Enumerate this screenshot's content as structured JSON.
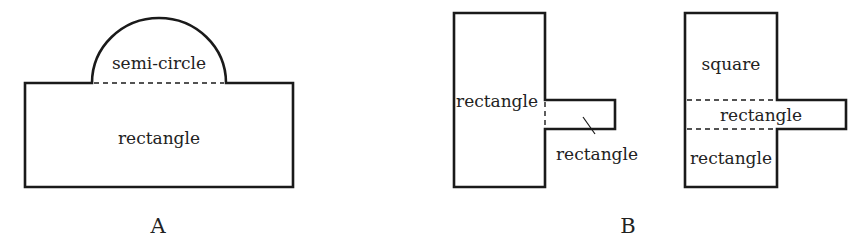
{
  "figures": {
    "A": {
      "caption": "A",
      "labels": {
        "semicircle": "semi-circle",
        "rectangle": "rectangle"
      }
    },
    "B": {
      "caption": "B",
      "left": {
        "labels": {
          "main_rectangle": "rectangle",
          "tab_rectangle": "rectangle"
        }
      },
      "right": {
        "labels": {
          "square": "square",
          "middle_rectangle": "rectangle",
          "bottom_rectangle": "rectangle"
        }
      }
    }
  },
  "colors": {
    "stroke": "#1a1a1a",
    "text": "#222222",
    "background": "#ffffff"
  }
}
